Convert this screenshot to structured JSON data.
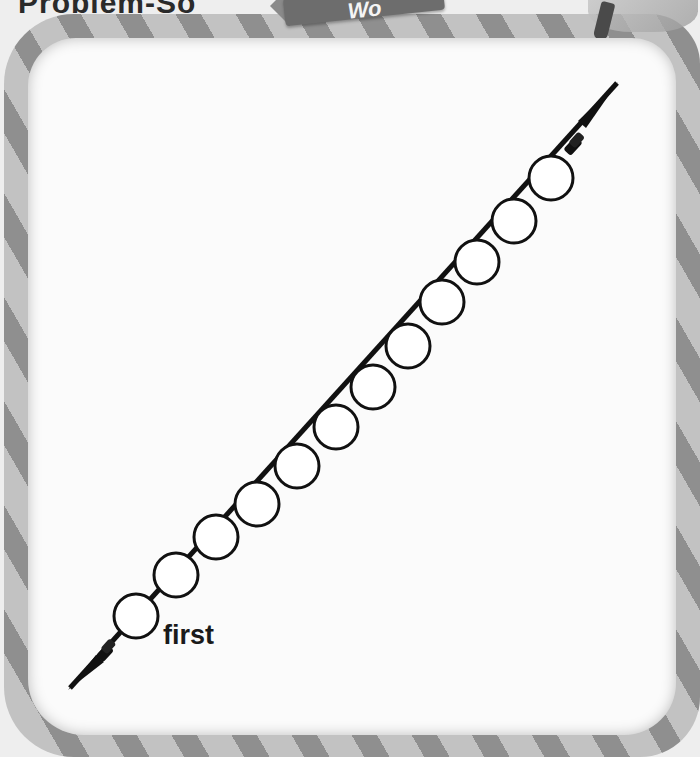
{
  "header": {
    "title": "Problem-So",
    "banner_text": "Wo"
  },
  "activity": {
    "type": "bead string ordinal diagram",
    "bead_count": 12,
    "start_label": "first",
    "bead_fill": "#ffffff",
    "bead_outline": "#111111",
    "string_color": "#111111",
    "beads": [
      {
        "index": 1,
        "cx": 136,
        "cy": 616
      },
      {
        "index": 2,
        "cx": 176,
        "cy": 575
      },
      {
        "index": 3,
        "cx": 216,
        "cy": 537
      },
      {
        "index": 4,
        "cx": 257,
        "cy": 504
      },
      {
        "index": 5,
        "cx": 297,
        "cy": 466
      },
      {
        "index": 6,
        "cx": 336,
        "cy": 427
      },
      {
        "index": 7,
        "cx": 373,
        "cy": 387
      },
      {
        "index": 8,
        "cx": 408,
        "cy": 346
      },
      {
        "index": 9,
        "cx": 442,
        "cy": 302
      },
      {
        "index": 10,
        "cx": 477,
        "cy": 262
      },
      {
        "index": 11,
        "cx": 514,
        "cy": 221
      },
      {
        "index": 12,
        "cx": 551,
        "cy": 178
      }
    ]
  },
  "frame": {
    "style": "striped candy border",
    "stripe_dark": "#8f8f8f",
    "stripe_light": "#c2c2c2"
  }
}
